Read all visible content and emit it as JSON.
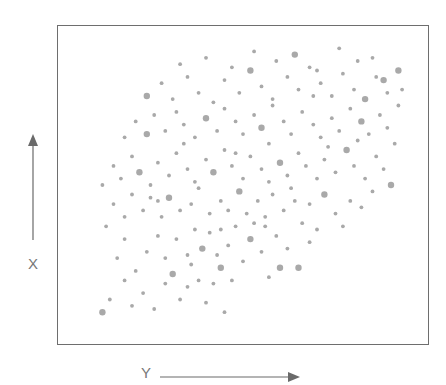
{
  "figure": {
    "vertical_axis_label": "X",
    "horizontal_axis_label": "Y",
    "colors": {
      "dot": "#a9a9a9",
      "frame": "#6e6e6e",
      "arrow": "#6a6a6a",
      "label": "#777777"
    }
  },
  "chart_data": {
    "type": "scatter",
    "title": "",
    "xlabel": "Y",
    "ylabel": "X",
    "xlim": [
      0,
      100
    ],
    "ylim": [
      0,
      100
    ],
    "grid": false,
    "legend": null,
    "annotations": [
      "Arrow pointing right beside horizontal label 'Y'",
      "Arrow pointing up above vertical label 'X'"
    ],
    "note": "Conceptual scatter with no tick labels; coordinates are normalized to the plot frame (0-100), estimated from pixel positions. Positive correlation, cloud spread diagonally from lower-left to upper-right.",
    "points": [
      [
        12,
        10,
        1
      ],
      [
        14,
        14,
        0
      ],
      [
        18,
        20,
        0
      ],
      [
        20,
        12,
        0
      ],
      [
        23,
        16,
        0
      ],
      [
        26,
        11,
        0
      ],
      [
        29,
        19,
        0
      ],
      [
        31,
        22,
        1
      ],
      [
        33,
        14,
        0
      ],
      [
        35,
        18,
        0
      ],
      [
        38,
        20,
        0
      ],
      [
        40,
        13,
        0
      ],
      [
        42,
        19,
        0
      ],
      [
        45,
        10,
        0
      ],
      [
        44,
        24,
        1
      ],
      [
        47,
        20,
        0
      ],
      [
        16,
        27,
        0
      ],
      [
        18,
        33,
        0
      ],
      [
        21,
        23,
        0
      ],
      [
        24,
        29,
        0
      ],
      [
        27,
        34,
        0
      ],
      [
        29,
        27,
        0
      ],
      [
        32,
        33,
        0
      ],
      [
        35,
        28,
        0
      ],
      [
        37,
        36,
        0
      ],
      [
        39,
        30,
        1
      ],
      [
        41,
        35,
        0
      ],
      [
        43,
        28,
        0
      ],
      [
        46,
        31,
        0
      ],
      [
        48,
        37,
        0
      ],
      [
        50,
        26,
        0
      ],
      [
        52,
        33,
        1
      ],
      [
        55,
        29,
        0
      ],
      [
        57,
        21,
        0
      ],
      [
        60,
        24,
        1
      ],
      [
        62,
        30,
        0
      ],
      [
        65,
        24,
        1
      ],
      [
        68,
        32,
        0
      ],
      [
        56,
        37,
        0
      ],
      [
        59,
        34,
        0
      ],
      [
        13,
        37,
        0
      ],
      [
        15,
        44,
        0
      ],
      [
        18,
        40,
        0
      ],
      [
        20,
        47,
        0
      ],
      [
        23,
        42,
        0
      ],
      [
        25,
        46,
        0
      ],
      [
        28,
        40,
        0
      ],
      [
        30,
        46,
        1
      ],
      [
        33,
        42,
        0
      ],
      [
        36,
        44,
        0
      ],
      [
        38,
        49,
        0
      ],
      [
        41,
        41,
        0
      ],
      [
        44,
        45,
        0
      ],
      [
        46,
        42,
        0
      ],
      [
        49,
        48,
        1
      ],
      [
        51,
        41,
        0
      ],
      [
        54,
        45,
        0
      ],
      [
        56,
        40,
        0
      ],
      [
        58,
        47,
        0
      ],
      [
        61,
        42,
        0
      ],
      [
        63,
        49,
        0
      ],
      [
        66,
        38,
        0
      ],
      [
        68,
        44,
        0
      ],
      [
        70,
        36,
        0
      ],
      [
        72,
        47,
        1
      ],
      [
        75,
        41,
        0
      ],
      [
        77,
        37,
        0
      ],
      [
        79,
        45,
        0
      ],
      [
        82,
        43,
        0
      ],
      [
        85,
        48,
        0
      ],
      [
        12,
        50,
        0
      ],
      [
        15,
        56,
        0
      ],
      [
        17,
        52,
        0
      ],
      [
        20,
        59,
        0
      ],
      [
        22,
        54,
        1
      ],
      [
        25,
        50,
        0
      ],
      [
        27,
        57,
        0
      ],
      [
        30,
        53,
        0
      ],
      [
        32,
        60,
        0
      ],
      [
        35,
        55,
        0
      ],
      [
        37,
        51,
        0
      ],
      [
        40,
        58,
        0
      ],
      [
        42,
        54,
        1
      ],
      [
        45,
        61,
        0
      ],
      [
        47,
        56,
        0
      ],
      [
        50,
        52,
        0
      ],
      [
        52,
        59,
        0
      ],
      [
        55,
        55,
        0
      ],
      [
        57,
        51,
        0
      ],
      [
        60,
        57,
        1
      ],
      [
        62,
        53,
        0
      ],
      [
        65,
        60,
        0
      ],
      [
        67,
        56,
        0
      ],
      [
        70,
        52,
        0
      ],
      [
        72,
        58,
        0
      ],
      [
        75,
        54,
        0
      ],
      [
        78,
        61,
        1
      ],
      [
        80,
        56,
        0
      ],
      [
        83,
        52,
        0
      ],
      [
        86,
        59,
        0
      ],
      [
        88,
        55,
        0
      ],
      [
        90,
        50,
        1
      ],
      [
        18,
        65,
        0
      ],
      [
        21,
        70,
        0
      ],
      [
        24,
        66,
        1
      ],
      [
        26,
        72,
        0
      ],
      [
        29,
        67,
        0
      ],
      [
        32,
        73,
        0
      ],
      [
        34,
        69,
        0
      ],
      [
        37,
        65,
        0
      ],
      [
        40,
        71,
        1
      ],
      [
        43,
        67,
        0
      ],
      [
        45,
        74,
        0
      ],
      [
        48,
        70,
        0
      ],
      [
        50,
        66,
        0
      ],
      [
        53,
        72,
        0
      ],
      [
        55,
        68,
        1
      ],
      [
        58,
        75,
        0
      ],
      [
        61,
        70,
        0
      ],
      [
        63,
        66,
        0
      ],
      [
        66,
        73,
        0
      ],
      [
        69,
        69,
        0
      ],
      [
        71,
        65,
        0
      ],
      [
        74,
        71,
        0
      ],
      [
        76,
        67,
        0
      ],
      [
        79,
        74,
        0
      ],
      [
        82,
        70,
        1
      ],
      [
        84,
        66,
        0
      ],
      [
        87,
        72,
        0
      ],
      [
        89,
        68,
        0
      ],
      [
        91,
        63,
        0
      ],
      [
        24,
        78,
        1
      ],
      [
        28,
        82,
        0
      ],
      [
        31,
        77,
        0
      ],
      [
        35,
        84,
        0
      ],
      [
        38,
        79,
        0
      ],
      [
        42,
        76,
        0
      ],
      [
        45,
        83,
        0
      ],
      [
        49,
        79,
        0
      ],
      [
        52,
        86,
        1
      ],
      [
        55,
        81,
        0
      ],
      [
        58,
        77,
        0
      ],
      [
        62,
        84,
        0
      ],
      [
        65,
        80,
        0
      ],
      [
        68,
        87,
        0
      ],
      [
        71,
        82,
        0
      ],
      [
        74,
        78,
        0
      ],
      [
        77,
        85,
        0
      ],
      [
        80,
        80,
        0
      ],
      [
        83,
        77,
        1
      ],
      [
        86,
        84,
        0
      ],
      [
        89,
        79,
        0
      ],
      [
        92,
        75,
        0
      ],
      [
        33,
        88,
        0
      ],
      [
        40,
        90,
        0
      ],
      [
        47,
        87,
        0
      ],
      [
        53,
        92,
        0
      ],
      [
        59,
        89,
        0
      ],
      [
        64,
        91,
        1
      ],
      [
        70,
        86,
        0
      ],
      [
        76,
        93,
        0
      ],
      [
        81,
        89,
        0
      ],
      [
        85,
        90,
        0
      ],
      [
        88,
        83,
        1
      ],
      [
        92,
        86,
        1
      ],
      [
        93,
        80,
        0
      ],
      [
        48,
        60,
        0
      ],
      [
        34,
        63,
        0
      ],
      [
        64,
        45,
        0
      ],
      [
        57,
        63,
        0
      ],
      [
        73,
        62,
        0
      ],
      [
        44,
        36,
        0
      ],
      [
        27,
        45,
        0
      ],
      [
        81,
        64,
        0
      ],
      [
        69,
        78,
        0
      ],
      [
        36,
        25,
        0
      ],
      [
        53,
        38,
        0
      ]
    ]
  }
}
